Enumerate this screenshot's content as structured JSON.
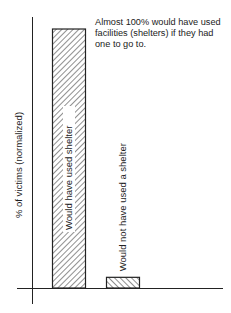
{
  "chart_data": {
    "type": "bar",
    "title": "",
    "xlabel": "",
    "ylabel": "% of victims (normalized)",
    "ylim": [
      0,
      100
    ],
    "categories": [
      "Would have used shelter",
      "Would not have used a shelter"
    ],
    "values": [
      97,
      4
    ],
    "bar_labels_rotated": true,
    "hatch": [
      "forward-diagonal",
      "back-diagonal"
    ],
    "grid": false,
    "legend": "none",
    "annotations": [
      "Almost 100% would have used facilities (shelters) if they had one to go to."
    ],
    "colors": {
      "ink": "#222222",
      "background": "#ffffff"
    }
  }
}
